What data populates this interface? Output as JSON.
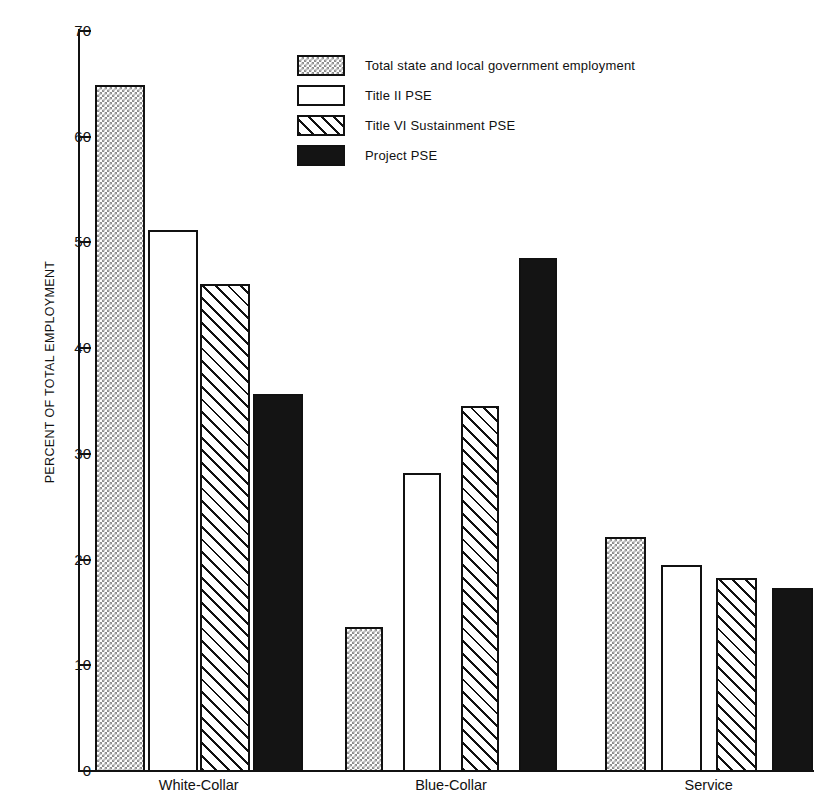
{
  "chart_data": {
    "type": "bar",
    "title": "",
    "xlabel": "",
    "ylabel": "PERCENT OF TOTAL EMPLOYMENT",
    "ylim": [
      0,
      70
    ],
    "yticks": [
      0,
      10,
      20,
      30,
      40,
      50,
      60,
      70
    ],
    "ytick_labels": [
      "0",
      "10",
      "20",
      "30",
      "40",
      "50",
      "60",
      "70"
    ],
    "grid": false,
    "legend_position": "top-center",
    "categories": [
      "White-Collar",
      "Blue-Collar",
      "Service"
    ],
    "series": [
      {
        "name": "Total state and local government employment",
        "pattern": "checker",
        "values": [
          65.0,
          13.7,
          22.2
        ]
      },
      {
        "name": "Title II PSE",
        "pattern": "open",
        "values": [
          51.3,
          28.3,
          19.6
        ]
      },
      {
        "name": "Title VI Sustainment PSE",
        "pattern": "hatch",
        "values": [
          46.2,
          34.6,
          18.4
        ]
      },
      {
        "name": "Project PSE",
        "pattern": "solid",
        "values": [
          35.8,
          48.6,
          17.4
        ]
      }
    ]
  },
  "legend": {
    "items": [
      {
        "label": "Total state and local government employment",
        "pattern": "checker"
      },
      {
        "label": "Title II PSE",
        "pattern": "open"
      },
      {
        "label": "Title VI Sustainment PSE",
        "pattern": "hatch"
      },
      {
        "label": "Project PSE",
        "pattern": "solid"
      }
    ]
  },
  "colors": {
    "axis": "#111111",
    "background": "#ffffff",
    "checker_fill": "#8d8d8d",
    "solid_fill": "#141414"
  }
}
